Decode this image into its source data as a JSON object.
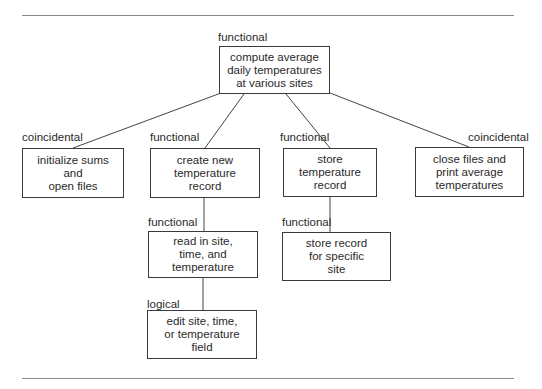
{
  "diagram": {
    "type": "structure-chart",
    "nodes": [
      {
        "id": "root",
        "text": "compute average\ndaily temperatures\nat various sites",
        "cohesion": "functional"
      },
      {
        "id": "init",
        "text": "initialize sums\nand\nopen files",
        "cohesion": "coincidental"
      },
      {
        "id": "create",
        "text": "create new\ntemperature\nrecord",
        "cohesion": "functional"
      },
      {
        "id": "store",
        "text": "store\ntemperature\nrecord",
        "cohesion": "functional"
      },
      {
        "id": "close",
        "text": "close files and\nprint average\ntemperatures",
        "cohesion": "coincidental"
      },
      {
        "id": "read",
        "text": "read in site,\ntime, and\ntemperature",
        "cohesion": "functional"
      },
      {
        "id": "storesite",
        "text": "store record\nfor specific\nsite",
        "cohesion": "functional"
      },
      {
        "id": "edit",
        "text": "edit site, time,\nor temperature\nfield",
        "cohesion": "logical"
      }
    ],
    "edges": [
      [
        "root",
        "init"
      ],
      [
        "root",
        "create"
      ],
      [
        "root",
        "store"
      ],
      [
        "root",
        "close"
      ],
      [
        "create",
        "read"
      ],
      [
        "read",
        "edit"
      ],
      [
        "store",
        "storesite"
      ]
    ]
  }
}
